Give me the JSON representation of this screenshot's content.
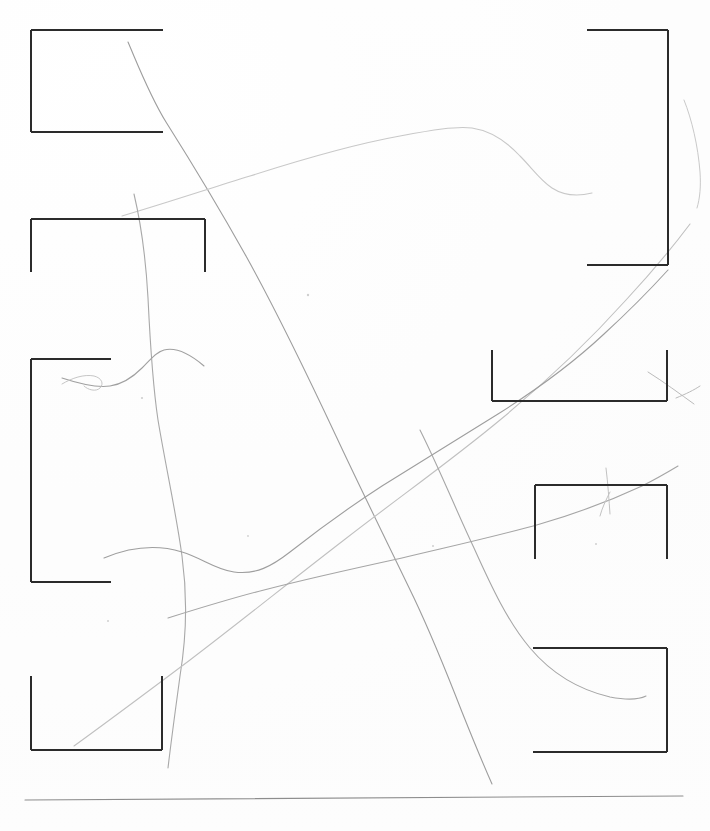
{
  "document": {
    "kind": "scanned-paper-sheet",
    "width": 710,
    "height": 831,
    "paper_color": "#ffffff",
    "ink_color": "#2b2b2b",
    "pencil_color": "#9a9a9a",
    "pencil_color_light": "#c4c4c4",
    "rule_color": "#8a8a8a",
    "visible_text": "",
    "caption": ""
  },
  "brackets": [
    {
      "name": "bracket-top-left",
      "orientation": "opens-right",
      "x": 31,
      "y": 30,
      "w": 132,
      "h": 102,
      "sides": [
        "top",
        "left",
        "bottom"
      ],
      "stroke_width": 2.0
    },
    {
      "name": "bracket-upper-left",
      "orientation": "opens-down",
      "x": 31,
      "y": 219,
      "w": 174,
      "h": 53,
      "sides": [
        "top",
        "left",
        "right"
      ],
      "stroke_width": 2.0
    },
    {
      "name": "bracket-mid-left",
      "orientation": "opens-right",
      "x": 31,
      "y": 359,
      "w": 80,
      "h": 223,
      "sides": [
        "top",
        "left",
        "bottom"
      ],
      "stroke_width": 2.0
    },
    {
      "name": "bracket-bottom-left",
      "orientation": "opens-up",
      "x": 31,
      "y": 676,
      "w": 131,
      "h": 74,
      "sides": [
        "left",
        "bottom",
        "right"
      ],
      "stroke_width": 2.0
    },
    {
      "name": "bracket-top-right",
      "orientation": "opens-left",
      "x": 587,
      "y": 30,
      "w": 81,
      "h": 235,
      "sides": [
        "top",
        "right",
        "bottom"
      ],
      "stroke_width": 2.0
    },
    {
      "name": "bracket-mid-right",
      "orientation": "opens-up",
      "x": 492,
      "y": 350,
      "w": 175,
      "h": 51,
      "sides": [
        "left",
        "bottom",
        "right"
      ],
      "stroke_width": 2.0
    },
    {
      "name": "bracket-lower-right",
      "orientation": "opens-down",
      "x": 535,
      "y": 485,
      "w": 132,
      "h": 74,
      "sides": [
        "top",
        "left",
        "right"
      ],
      "stroke_width": 2.0
    },
    {
      "name": "bracket-bottom-right",
      "orientation": "opens-left",
      "x": 533,
      "y": 648,
      "w": 134,
      "h": 104,
      "sides": [
        "top",
        "right",
        "bottom"
      ],
      "stroke_width": 2.0
    }
  ],
  "rule": {
    "name": "bottom-horizontal-rule",
    "x1": 25,
    "y1": 800,
    "x2": 683,
    "y2": 796,
    "stroke_width": 1.1,
    "color": "#8d8d8d"
  },
  "pencil_strokes": [
    {
      "name": "stroke-long-diagonal",
      "description": "long curve from upper-left descending to lower-right then down past bottom",
      "color": "#9d9d9d",
      "width": 1.1,
      "path": "M128,42 C140,70 150,96 166,122 C190,160 218,206 246,256 C276,310 306,372 336,436 C364,496 392,552 414,598 C432,636 448,676 462,712 C474,742 484,766 492,784"
    },
    {
      "name": "stroke-top-hump",
      "description": "faint mountain-like curve across the top arching to a peak then falling right",
      "color": "#c8c8c8",
      "width": 1.1,
      "path": "M122,216 C160,205 205,190 250,176 C300,160 350,145 400,136 C432,130 456,126 472,128 C492,131 508,143 520,156 C532,168 540,180 552,188 C566,197 580,196 592,193"
    },
    {
      "name": "stroke-near-vertical",
      "description": "near vertical wandering curve from upper area down through bottom-left bracket",
      "color": "#a8a8a8",
      "width": 1.1,
      "path": "M134,194 C142,228 146,262 148,298 C150,340 152,380 158,420 C166,468 176,512 182,556 C188,600 186,640 180,676 C176,706 172,734 168,768"
    },
    {
      "name": "stroke-mid-rising",
      "description": "light curve rising from bottom-left toward upper-right corner of page",
      "color": "#c0c0c0",
      "width": 1.1,
      "path": "M74,746 C110,720 150,690 190,660 C240,622 292,580 344,540 C398,498 452,460 500,420 C546,382 590,340 626,300 C652,272 672,248 690,224"
    },
    {
      "name": "stroke-lower-sweep",
      "description": "shallow S curve sweeping left to right across the lower middle",
      "color": "#a0a0a0",
      "width": 1.1,
      "path": "M62,378 C80,384 96,388 110,386 C124,384 134,376 142,368 C150,360 156,352 164,350 C176,347 190,354 204,366"
    },
    {
      "name": "stroke-mid-left-wave",
      "description": "gentle wave across the middle-left toward a junction then rising right",
      "color": "#9e9e9e",
      "width": 1.1,
      "path": "M104,558 C128,548 156,544 182,552 C202,558 216,570 234,572 C256,575 272,566 290,552 C318,530 348,508 382,486 C420,462 460,438 498,414 C536,390 572,364 604,334 C628,312 648,292 668,270"
    },
    {
      "name": "stroke-lower-right-sweep",
      "description": "long shallow curve from lower-left rising to the right edge",
      "color": "#a5a5a5",
      "width": 1.1,
      "path": "M168,618 C200,608 232,598 264,590 C310,578 356,568 402,558 C452,546 498,536 540,524 C578,513 612,500 642,486 C656,479 668,472 678,466"
    },
    {
      "name": "stroke-bottom-right-hook",
      "description": "curve descending from the middle right and hooking into the bottom-right bracket",
      "color": "#a6a6a6",
      "width": 1.1,
      "path": "M420,430 C440,470 456,510 474,548 C492,588 508,622 530,648 C552,674 580,690 610,697 C626,700 638,700 646,696"
    },
    {
      "name": "stroke-short-left-hook",
      "description": "short faint hook near the mid-left bracket opening",
      "color": "#c6c6c6",
      "width": 1.0,
      "path": "M62,384 C72,378 84,374 94,376 C102,378 104,384 100,388 C96,392 88,390 84,386"
    },
    {
      "name": "stroke-right-edge-wisp",
      "description": "faint wisp along the upper right edge of the sheet",
      "color": "#c9c9c9",
      "width": 1.0,
      "path": "M684,100 C692,120 698,146 700,172 C701,186 700,198 697,208"
    },
    {
      "name": "stroke-right-bracket-wisp",
      "description": "small wisp crossing the mid-right bracket corner",
      "color": "#bbbbbb",
      "width": 1.0,
      "path": "M648,372 C664,382 680,394 694,404 M676,398 C686,394 694,390 700,386"
    },
    {
      "name": "stroke-lower-right-tick",
      "description": "short vertical tick over the lower-right bracket top edge",
      "color": "#c2c2c2",
      "width": 1.0,
      "path": "M606,468 C608,484 609,500 610,514 M610,492 C606,500 602,508 600,516"
    }
  ],
  "specks": [
    {
      "name": "speck-1",
      "x": 308,
      "y": 295,
      "r": 1.2
    },
    {
      "name": "speck-2",
      "x": 142,
      "y": 398,
      "r": 1.1
    },
    {
      "name": "speck-3",
      "x": 433,
      "y": 546,
      "r": 1.0
    },
    {
      "name": "speck-4",
      "x": 108,
      "y": 621,
      "r": 1.0
    },
    {
      "name": "speck-5",
      "x": 596,
      "y": 544,
      "r": 1.0
    },
    {
      "name": "speck-6",
      "x": 248,
      "y": 536,
      "r": 0.9
    }
  ]
}
